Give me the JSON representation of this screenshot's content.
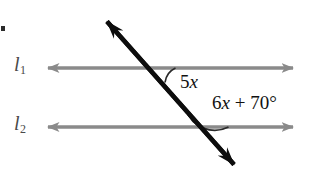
{
  "figure": {
    "type": "geometry-diagram",
    "background_color": "#ffffff",
    "width": 313,
    "height": 185
  },
  "labels": {
    "line1_name": "l",
    "line1_subscript": "1",
    "line2_name": "l",
    "line2_subscript": "2"
  },
  "angles": {
    "angle1": {
      "coefficient": "5",
      "variable": "x",
      "full_text": "5x"
    },
    "angle2": {
      "coefficient": "6",
      "variable": "x",
      "operator": "+",
      "constant": "70",
      "degree_symbol": "°",
      "full_text": "6x + 70°"
    }
  },
  "colors": {
    "parallel_line": "#8a8a8a",
    "transversal": "#0d0d0d",
    "arc": "#2a2a2a",
    "label_text": "#4a4a4a",
    "angle_text": "#111111"
  },
  "geometry": {
    "line1_y": 68,
    "line2_y": 127,
    "line_x_start": 36,
    "line_x_end": 305,
    "transversal_top": [
      95,
      8
    ],
    "transversal_bottom": [
      246,
      178
    ],
    "intersection1": [
      157,
      68
    ],
    "intersection2": [
      198,
      127
    ]
  }
}
